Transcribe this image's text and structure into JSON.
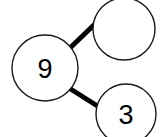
{
  "diagram": {
    "type": "number-bond",
    "background_color": "#ffffff",
    "stroke_color": "#1a1a1a",
    "link_color": "#000000",
    "text_color": "#000000",
    "whole": {
      "label": "9",
      "role": "whole",
      "cx": 45,
      "cy": 68,
      "r": 33
    },
    "parts": [
      {
        "label": "",
        "role": "part-missing",
        "cx": 124,
        "cy": 29,
        "r": 31
      },
      {
        "label": "3",
        "role": "part",
        "cx": 126,
        "cy": 114,
        "r": 30
      }
    ],
    "links": [
      {
        "name": "link-whole-to-part-1",
        "x1": 70,
        "y1": 48,
        "x2": 97,
        "y2": 22
      },
      {
        "name": "link-whole-to-part-2",
        "x1": 69,
        "y1": 88,
        "x2": 99,
        "y2": 107
      }
    ]
  }
}
